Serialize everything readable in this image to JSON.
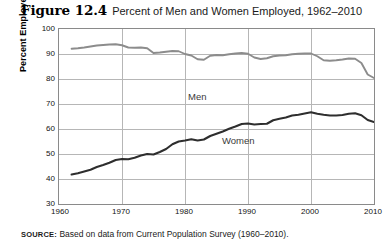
{
  "figure": {
    "number": "Figure 12.4",
    "caption": "Percent of Men and Women Employed, 1962–2010"
  },
  "source": {
    "lead": "SOURCE:",
    "text": "Based on data from Current Population Survey (1960–2010)."
  },
  "labels": {
    "men": "Men",
    "women": "Women"
  },
  "colors": {
    "men_line": "#8c8c8c",
    "women_line": "#2e2e2e",
    "grid": "#b6b6b6",
    "frame": "#8a8a8a"
  },
  "chart_data": {
    "type": "line",
    "title": "Percent of Men and Women Employed, 1962–2010",
    "xlabel": "",
    "ylabel": "Percent Employed",
    "xlim": [
      1960,
      2010
    ],
    "ylim": [
      30,
      100
    ],
    "xticks": [
      1960,
      1970,
      1980,
      1990,
      2000,
      2010
    ],
    "yticks": [
      30,
      40,
      50,
      60,
      70,
      80,
      90,
      100
    ],
    "grid": true,
    "legend": "inline-labels",
    "x": [
      1962,
      1963,
      1964,
      1965,
      1966,
      1967,
      1968,
      1969,
      1970,
      1971,
      1972,
      1973,
      1974,
      1975,
      1976,
      1977,
      1978,
      1979,
      1980,
      1981,
      1982,
      1983,
      1984,
      1985,
      1986,
      1987,
      1988,
      1989,
      1990,
      1991,
      1992,
      1993,
      1994,
      1995,
      1996,
      1997,
      1998,
      1999,
      2000,
      2001,
      2002,
      2003,
      2004,
      2005,
      2006,
      2007,
      2008,
      2009,
      2010
    ],
    "series": [
      {
        "name": "Men",
        "color": "#8c8c8c",
        "values": [
          92.1,
          92.3,
          92.6,
          93.0,
          93.4,
          93.6,
          93.8,
          93.9,
          93.5,
          92.6,
          92.5,
          92.6,
          92.3,
          90.4,
          90.6,
          90.9,
          91.2,
          91.1,
          90.0,
          89.4,
          87.9,
          87.7,
          89.3,
          89.6,
          89.5,
          89.9,
          90.2,
          90.4,
          90.1,
          88.6,
          88.0,
          88.3,
          89.1,
          89.4,
          89.5,
          89.9,
          90.1,
          90.2,
          90.2,
          89.1,
          87.5,
          87.3,
          87.5,
          87.8,
          88.2,
          88.1,
          86.4,
          81.8,
          80.4
        ]
      },
      {
        "name": "Women",
        "color": "#2e2e2e",
        "values": [
          41.8,
          42.3,
          43.0,
          43.7,
          44.8,
          45.6,
          46.5,
          47.6,
          48.0,
          47.9,
          48.5,
          49.4,
          50.0,
          49.8,
          50.8,
          52.0,
          53.9,
          55.0,
          55.4,
          55.9,
          55.4,
          55.8,
          57.2,
          58.1,
          59.0,
          60.1,
          61.0,
          62.0,
          62.2,
          61.8,
          62.0,
          62.1,
          63.5,
          64.1,
          64.6,
          65.4,
          65.7,
          66.2,
          66.7,
          66.1,
          65.7,
          65.4,
          65.4,
          65.6,
          66.1,
          66.3,
          65.5,
          63.6,
          62.8
        ]
      }
    ],
    "notes": [
      "Men employment begins near 92% in 1962, peaks around 94% in 1968–1969, dips to roughly 88% in 1982–1983, holds near 90% through the 1990s, and falls sharply after 2007 to about 80% in 2010.",
      "Women employment rises steadily from about 42% in 1962 to a peak near 75% around 2000, then eases and drops to roughly 70% by 2010."
    ]
  }
}
